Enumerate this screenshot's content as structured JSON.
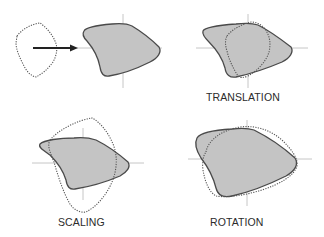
{
  "figure": {
    "panels": [
      {
        "id": "original",
        "label": ""
      },
      {
        "id": "translation",
        "label": "TRANSLATION"
      },
      {
        "id": "scaling",
        "label": "SCALING"
      },
      {
        "id": "rotation",
        "label": "ROTATION"
      }
    ]
  },
  "colors": {
    "shape_fill": "#c4c4c4",
    "shape_stroke": "#4a4a4a",
    "axis": "#b8b8b8",
    "arrow": "#222222",
    "text": "#2b2b2b"
  }
}
